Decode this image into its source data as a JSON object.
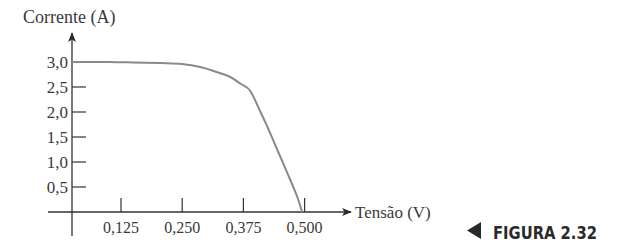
{
  "figure": {
    "label": "FIGURA 2.32",
    "pointer_icon": "left-triangle-icon"
  },
  "chart_data": {
    "type": "line",
    "title": "",
    "xlabel": "Tensão (V)",
    "ylabel": "Corrente (A)",
    "x_ticks": [
      0.125,
      0.25,
      0.375,
      0.5
    ],
    "x_tick_labels": [
      "0,125",
      "0,250",
      "0,375",
      "0,500"
    ],
    "y_ticks": [
      0.5,
      1.0,
      1.5,
      2.0,
      2.5,
      3.0
    ],
    "y_tick_labels": [
      "0,5",
      "1,0",
      "1,5",
      "2,0",
      "2,5",
      "3,0"
    ],
    "xlim": [
      0.025,
      0.54
    ],
    "ylim": [
      0,
      3.6
    ],
    "grid": false,
    "legend": null,
    "series": [
      {
        "name": "I-V curve",
        "color": "#8a8a8a",
        "x": [
          0.025,
          0.1,
          0.15,
          0.205,
          0.25,
          0.287,
          0.32,
          0.348,
          0.37,
          0.389,
          0.41,
          0.425,
          0.44,
          0.455,
          0.47,
          0.485,
          0.495
        ],
        "y": [
          3.0,
          3.0,
          2.99,
          2.98,
          2.96,
          2.9,
          2.8,
          2.7,
          2.56,
          2.42,
          2.0,
          1.68,
          1.34,
          1.0,
          0.66,
          0.3,
          0.0
        ]
      }
    ]
  }
}
